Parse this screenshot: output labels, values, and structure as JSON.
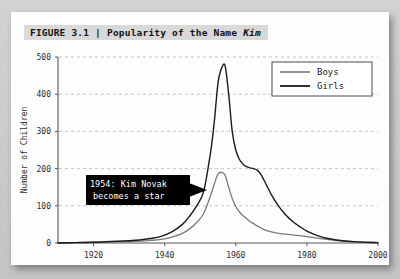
{
  "figure": {
    "label": "FIGURE 3.1",
    "separator": "|",
    "title_plain": "Popularity of the Name ",
    "title_italic": "Kim",
    "full_title": "FIGURE 3.1 | Popularity of the Name Kim"
  },
  "colors": {
    "girls_line": "#1a1a1a",
    "boys_line": "#7a7a7a",
    "gridline": "#bdbdbd",
    "axis": "#555555",
    "card_bg": "#fdfdfd",
    "page_bg": "#c9c9c9",
    "title_band_bg": "#d9d9d9",
    "annotation_bg": "#000000",
    "annotation_text": "#ffffff"
  },
  "annotation": {
    "line1": "1954: Kim Novak",
    "line2": "becomes a star",
    "year": 1954
  },
  "chart_data": {
    "type": "line",
    "title": "Popularity of the Name Kim",
    "xlabel": "",
    "ylabel": "Number of Children",
    "xlim": [
      1910,
      2000
    ],
    "ylim": [
      0,
      500
    ],
    "xticks": [
      1920,
      1940,
      1960,
      1980,
      2000
    ],
    "yticks": [
      0,
      100,
      200,
      300,
      400,
      500
    ],
    "grid": "horizontal-dashed",
    "legend_position": "top-right",
    "legend": [
      "Boys",
      "Girls"
    ],
    "x": [
      1910,
      1915,
      1920,
      1925,
      1930,
      1933,
      1936,
      1939,
      1942,
      1945,
      1947,
      1949,
      1951,
      1953,
      1954,
      1955,
      1956,
      1957,
      1958,
      1959,
      1960,
      1961,
      1962,
      1963,
      1964,
      1965,
      1966,
      1967,
      1968,
      1970,
      1972,
      1974,
      1976,
      1978,
      1980,
      1983,
      1986,
      1990,
      1994,
      2000
    ],
    "series": [
      {
        "name": "Boys",
        "color": "#7a7a7a",
        "values": [
          0,
          1,
          2,
          3,
          4,
          5,
          7,
          10,
          16,
          26,
          38,
          55,
          80,
          130,
          160,
          185,
          190,
          182,
          150,
          120,
          98,
          84,
          74,
          66,
          58,
          52,
          46,
          41,
          36,
          30,
          26,
          24,
          22,
          20,
          17,
          13,
          9,
          5,
          3,
          1
        ]
      },
      {
        "name": "Girls",
        "color": "#1a1a1a",
        "values": [
          0,
          1,
          2,
          4,
          6,
          8,
          12,
          18,
          30,
          50,
          72,
          100,
          140,
          250,
          330,
          430,
          470,
          476,
          400,
          300,
          250,
          225,
          212,
          205,
          202,
          200,
          196,
          185,
          168,
          130,
          100,
          76,
          58,
          44,
          32,
          20,
          12,
          6,
          3,
          1
        ]
      }
    ]
  }
}
